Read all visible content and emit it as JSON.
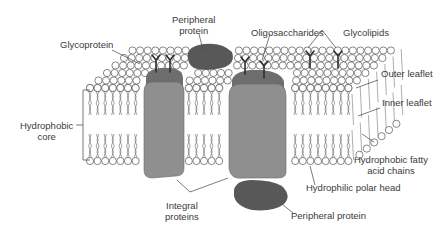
{
  "diagram": {
    "type": "cell-membrane-fluid-mosaic",
    "colors": {
      "background": "#ffffff",
      "lipid_outline": "#555555",
      "lipid_head_fill": "#ffffff",
      "integral_protein": "#8f8f8f",
      "integral_protein_cap": "#6e6e6e",
      "peripheral_protein": "#585858",
      "sugar_chain": "#2e2e2e",
      "leader_line": "#444444",
      "label_text": "#3a3a3a"
    },
    "labels": {
      "peripheral_protein_top_line1": "Peripheral",
      "peripheral_protein_top_line2": "protein",
      "glycoprotein": "Glycoprotein",
      "oligosaccharides": "Oligosaccharides",
      "glycolipids": "Glycolipids",
      "outer_leaflet": "Outer leaflet",
      "inner_leaflet": "Inner leaflet",
      "hydrophobic_core_line1": "Hydrophobic",
      "hydrophobic_core_line2": "core",
      "hydrophobic_fatty_line1": "Hydrophobic fatty",
      "hydrophobic_fatty_line2": "acid chains",
      "hydrophilic_polar_head": "Hydrophilic polar head",
      "integral_proteins_line1": "Integral",
      "integral_proteins_line2": "proteins",
      "peripheral_protein_bottom": "Peripheral protein"
    }
  }
}
